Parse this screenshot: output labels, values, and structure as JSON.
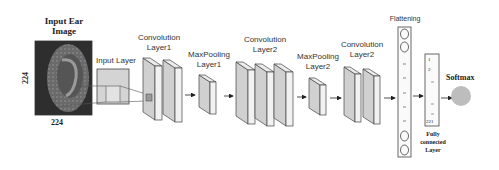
{
  "diagram": {
    "title_image": [
      "Input Ear",
      "Image"
    ],
    "image_height": "224",
    "image_width": "224",
    "layers": {
      "input": "Input Layer",
      "conv1": [
        "Convolution",
        "Layer1"
      ],
      "pool1": [
        "MaxPooling",
        "Layer1"
      ],
      "conv2": [
        "Convolution",
        "Layer2"
      ],
      "pool2": [
        "MaxPooling",
        "Layer2"
      ],
      "conv3": [
        "Convolution",
        "Layer2"
      ],
      "flatten": "Flattening",
      "fc": [
        "Fully",
        "connected",
        "Layer"
      ],
      "softmax": "Softmax"
    },
    "fc_units": {
      "first": "1",
      "second": "2",
      "last": "221"
    },
    "colors": {
      "block_front": "#d0d0d0",
      "block_side": "#f0f0f0",
      "softmax": "#bdbdbd",
      "stroke": "#555555"
    }
  }
}
